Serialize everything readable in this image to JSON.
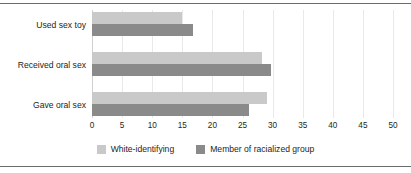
{
  "chart_data": {
    "type": "bar",
    "orientation": "horizontal",
    "title": "",
    "xlabel": "",
    "ylabel": "",
    "categories": [
      "Used sex toy",
      "Received oral sex",
      "Gave oral sex"
    ],
    "series": [
      {
        "name": "White-identifying",
        "color": "#c9c9c9",
        "values": [
          15,
          28.3,
          29
        ]
      },
      {
        "name": "Member of racialized group",
        "color": "#8a8a8a",
        "values": [
          16.7,
          29.8,
          26
        ]
      }
    ],
    "xlim": [
      0,
      50
    ],
    "xticks": [
      0,
      5,
      10,
      15,
      20,
      25,
      30,
      35,
      40,
      45,
      50
    ],
    "xtick_labels": [
      "0",
      "5",
      "10",
      "15",
      "20",
      "25",
      "30",
      "35",
      "40",
      "45",
      "50"
    ],
    "grid": true,
    "grid_color": "#e9e9e9",
    "legend_position": "bottom"
  },
  "legend": {
    "items": [
      {
        "label": "White-identifying",
        "color": "#c9c9c9"
      },
      {
        "label": "Member of racialized group",
        "color": "#8a8a8a"
      }
    ]
  },
  "frame": {
    "rule_color": "#6b6b6b"
  }
}
